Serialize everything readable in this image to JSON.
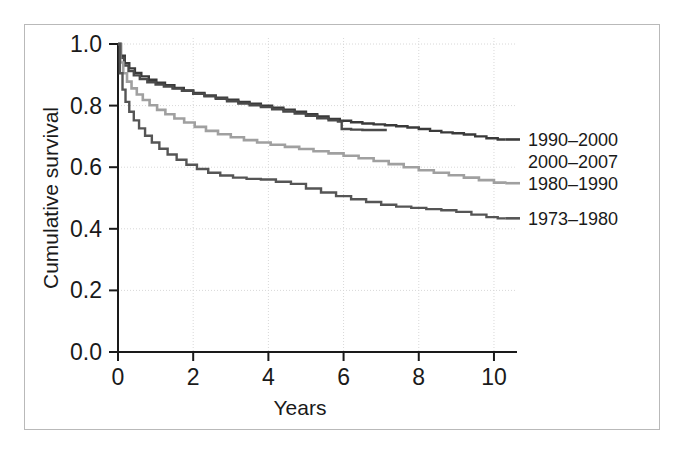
{
  "chart_data": {
    "type": "line",
    "title": "",
    "xlabel": "Years",
    "ylabel": "Cumulative survival",
    "xlim": [
      0,
      10.4
    ],
    "ylim": [
      0.0,
      1.0
    ],
    "xticks": [
      0,
      2,
      4,
      6,
      8,
      10
    ],
    "xtick_labels": [
      "0",
      "2",
      "4",
      "6",
      "8",
      "10"
    ],
    "yticks": [
      0.0,
      0.2,
      0.4,
      0.6,
      0.8,
      1.0
    ],
    "ytick_labels": [
      "0.0",
      "0.2",
      "0.4",
      "0.6",
      "0.8",
      "1.0"
    ],
    "grid": true,
    "grid_style": "dotted",
    "grid_color": "#d8d8d8",
    "legend_position": "right-inline",
    "series": [
      {
        "name": "1990–2000",
        "color": "#3a3a3a",
        "label_y": 0.69,
        "points": [
          [
            0.0,
            1.0
          ],
          [
            0.08,
            0.962
          ],
          [
            0.18,
            0.938
          ],
          [
            0.3,
            0.921
          ],
          [
            0.45,
            0.906
          ],
          [
            0.62,
            0.895
          ],
          [
            0.82,
            0.884
          ],
          [
            1.02,
            0.874
          ],
          [
            1.25,
            0.866
          ],
          [
            1.5,
            0.857
          ],
          [
            1.75,
            0.849
          ],
          [
            2.0,
            0.841
          ],
          [
            2.3,
            0.833
          ],
          [
            2.6,
            0.826
          ],
          [
            2.9,
            0.819
          ],
          [
            3.2,
            0.812
          ],
          [
            3.5,
            0.806
          ],
          [
            3.8,
            0.8
          ],
          [
            4.1,
            0.793
          ],
          [
            4.4,
            0.787
          ],
          [
            4.7,
            0.78
          ],
          [
            5.0,
            0.772
          ],
          [
            5.3,
            0.765
          ],
          [
            5.6,
            0.757
          ],
          [
            5.9,
            0.751
          ],
          [
            6.2,
            0.746
          ],
          [
            6.5,
            0.742
          ],
          [
            6.8,
            0.739
          ],
          [
            7.1,
            0.736
          ],
          [
            7.4,
            0.733
          ],
          [
            7.7,
            0.729
          ],
          [
            8.0,
            0.724
          ],
          [
            8.3,
            0.718
          ],
          [
            8.6,
            0.713
          ],
          [
            8.9,
            0.71
          ],
          [
            9.2,
            0.706
          ],
          [
            9.5,
            0.7
          ],
          [
            9.8,
            0.694
          ],
          [
            10.1,
            0.69
          ],
          [
            10.3,
            0.69
          ]
        ]
      },
      {
        "name": "2000–2007",
        "color": "#4a4a4a",
        "label_y": 0.62,
        "points": [
          [
            0.0,
            1.0
          ],
          [
            0.07,
            0.955
          ],
          [
            0.16,
            0.93
          ],
          [
            0.28,
            0.912
          ],
          [
            0.42,
            0.898
          ],
          [
            0.58,
            0.886
          ],
          [
            0.78,
            0.876
          ],
          [
            1.0,
            0.868
          ],
          [
            1.22,
            0.862
          ],
          [
            1.45,
            0.855
          ],
          [
            1.7,
            0.848
          ],
          [
            2.0,
            0.838
          ],
          [
            2.3,
            0.83
          ],
          [
            2.6,
            0.822
          ],
          [
            2.9,
            0.814
          ],
          [
            3.2,
            0.807
          ],
          [
            3.5,
            0.801
          ],
          [
            3.8,
            0.795
          ],
          [
            4.1,
            0.788
          ],
          [
            4.4,
            0.781
          ],
          [
            4.7,
            0.774
          ],
          [
            5.0,
            0.767
          ],
          [
            5.3,
            0.759
          ],
          [
            5.6,
            0.752
          ],
          [
            5.85,
            0.748
          ],
          [
            5.95,
            0.724
          ],
          [
            6.2,
            0.722
          ],
          [
            6.5,
            0.721
          ],
          [
            6.8,
            0.721
          ],
          [
            7.15,
            0.721
          ]
        ]
      },
      {
        "name": "1980–1990",
        "color": "#a0a0a0",
        "label_y": 0.548,
        "points": [
          [
            0.0,
            1.0
          ],
          [
            0.06,
            0.94
          ],
          [
            0.14,
            0.905
          ],
          [
            0.24,
            0.878
          ],
          [
            0.36,
            0.856
          ],
          [
            0.5,
            0.836
          ],
          [
            0.66,
            0.818
          ],
          [
            0.84,
            0.801
          ],
          [
            1.04,
            0.786
          ],
          [
            1.26,
            0.772
          ],
          [
            1.5,
            0.758
          ],
          [
            1.76,
            0.745
          ],
          [
            2.04,
            0.731
          ],
          [
            2.34,
            0.718
          ],
          [
            2.66,
            0.707
          ],
          [
            3.0,
            0.697
          ],
          [
            3.35,
            0.688
          ],
          [
            3.7,
            0.68
          ],
          [
            4.06,
            0.673
          ],
          [
            4.44,
            0.666
          ],
          [
            4.82,
            0.659
          ],
          [
            5.2,
            0.652
          ],
          [
            5.6,
            0.645
          ],
          [
            6.0,
            0.637
          ],
          [
            6.4,
            0.629
          ],
          [
            6.8,
            0.62
          ],
          [
            7.2,
            0.61
          ],
          [
            7.6,
            0.6
          ],
          [
            8.0,
            0.59
          ],
          [
            8.4,
            0.582
          ],
          [
            8.8,
            0.574
          ],
          [
            9.2,
            0.566
          ],
          [
            9.6,
            0.558
          ],
          [
            10.0,
            0.55
          ],
          [
            10.3,
            0.548
          ]
        ]
      },
      {
        "name": "1973–1980",
        "color": "#555555",
        "label_y": 0.434,
        "points": [
          [
            0.0,
            1.0
          ],
          [
            0.05,
            0.905
          ],
          [
            0.12,
            0.852
          ],
          [
            0.2,
            0.812
          ],
          [
            0.3,
            0.78
          ],
          [
            0.42,
            0.752
          ],
          [
            0.56,
            0.726
          ],
          [
            0.72,
            0.702
          ],
          [
            0.9,
            0.68
          ],
          [
            1.1,
            0.66
          ],
          [
            1.32,
            0.641
          ],
          [
            1.56,
            0.624
          ],
          [
            1.82,
            0.608
          ],
          [
            2.1,
            0.594
          ],
          [
            2.4,
            0.582
          ],
          [
            2.72,
            0.573
          ],
          [
            3.06,
            0.566
          ],
          [
            3.42,
            0.562
          ],
          [
            3.8,
            0.56
          ],
          [
            4.2,
            0.553
          ],
          [
            4.6,
            0.546
          ],
          [
            5.0,
            0.531
          ],
          [
            5.4,
            0.518
          ],
          [
            5.8,
            0.506
          ],
          [
            6.2,
            0.496
          ],
          [
            6.6,
            0.487
          ],
          [
            7.0,
            0.478
          ],
          [
            7.4,
            0.472
          ],
          [
            7.8,
            0.468
          ],
          [
            8.2,
            0.464
          ],
          [
            8.6,
            0.46
          ],
          [
            9.0,
            0.455
          ],
          [
            9.4,
            0.446
          ],
          [
            9.8,
            0.438
          ],
          [
            10.1,
            0.434
          ],
          [
            10.3,
            0.434
          ]
        ]
      }
    ],
    "legend_entries": [
      {
        "label": "1990–2000",
        "color": "#3a3a3a"
      },
      {
        "label": "2000–2007",
        "color": "#4a4a4a"
      },
      {
        "label": "1980–1990",
        "color": "#a0a0a0"
      },
      {
        "label": "1973–1980",
        "color": "#555555"
      }
    ]
  }
}
